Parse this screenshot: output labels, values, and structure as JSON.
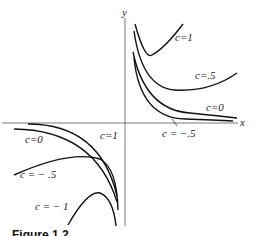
{
  "figure": {
    "caption": "Figure 1.2",
    "axes": {
      "x_label": "x",
      "y_label": "y"
    },
    "curve_labels": [
      {
        "id": "c1_right",
        "text": "c=1"
      },
      {
        "id": "c05_right",
        "text": "c=.5"
      },
      {
        "id": "c0_right",
        "text": "c=0"
      },
      {
        "id": "cm05_right",
        "text": "c = −.5"
      },
      {
        "id": "c0_left",
        "text": "c=0"
      },
      {
        "id": "c1_left",
        "text": "c=1"
      },
      {
        "id": "cm05_left",
        "text": "c = − .5"
      },
      {
        "id": "cm1_left",
        "text": "c = − 1"
      }
    ]
  }
}
